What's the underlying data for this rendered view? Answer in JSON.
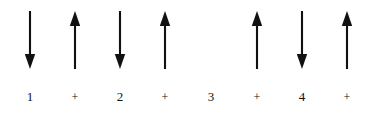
{
  "figure": {
    "kind": "strum-pattern-notation",
    "background_color": "#ffffff",
    "ink_color": "#111111",
    "columns": [
      {
        "label": "1",
        "label_kind": "beat",
        "arrow": "down",
        "center_x": 30
      },
      {
        "label": "+",
        "label_kind": "and",
        "arrow": "up",
        "center_x": 75
      },
      {
        "label": "2",
        "label_kind": "beat",
        "arrow": "down",
        "center_x": 120
      },
      {
        "label": "+",
        "label_kind": "and",
        "arrow": "up",
        "center_x": 165
      },
      {
        "label": "3",
        "label_kind": "beat",
        "arrow": "none",
        "center_x": 211
      },
      {
        "label": "+",
        "label_kind": "and",
        "arrow": "up",
        "center_x": 257
      },
      {
        "label": "4",
        "label_kind": "beat",
        "arrow": "down",
        "center_x": 302
      },
      {
        "label": "+",
        "label_kind": "and",
        "arrow": "up",
        "center_x": 347
      }
    ]
  }
}
